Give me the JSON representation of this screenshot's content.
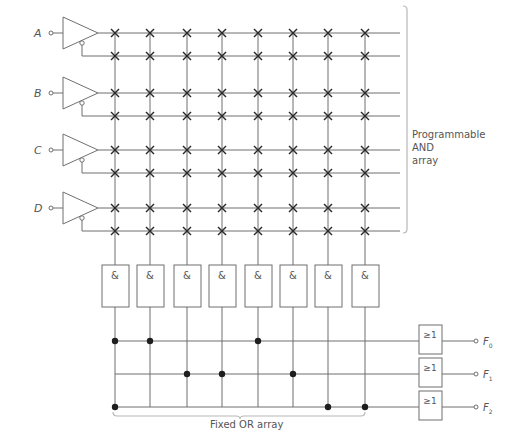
{
  "diagram": {
    "inputs": [
      {
        "label": "A",
        "y": 33,
        "ybar": 56
      },
      {
        "label": "B",
        "y": 93,
        "ybar": 116
      },
      {
        "label": "C",
        "y": 150,
        "ybar": 173
      },
      {
        "label": "D",
        "y": 208,
        "ybar": 231
      }
    ],
    "columns_x": [
      115,
      150,
      187,
      222,
      258,
      293,
      328,
      365
    ],
    "and_gate_symbol": "&",
    "and_gate_count": 8,
    "and_array_label": [
      "Programmable",
      "AND",
      "array"
    ],
    "or_array_label": "Fixed OR array",
    "or_gate_symbol": "≥1",
    "outputs": [
      {
        "label": "F",
        "sub": "0",
        "y": 341,
        "connections": [
          0,
          1,
          4
        ]
      },
      {
        "label": "F",
        "sub": "1",
        "y": 374,
        "connections": [
          2,
          3,
          5
        ]
      },
      {
        "label": "F",
        "sub": "2",
        "y": 407,
        "connections": [
          0,
          6,
          7
        ]
      }
    ],
    "fuse_marker": "x",
    "connection_marker": "dot",
    "colors": {
      "line": "#6f6f6f",
      "fuse": "#2a2a2a",
      "dot": "#1e1e1e",
      "text": "#555555",
      "brace": "#b8b8b8"
    }
  }
}
